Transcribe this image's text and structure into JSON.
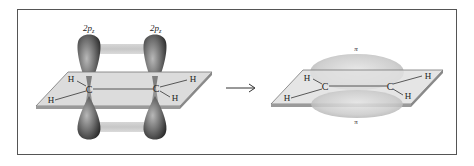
{
  "figure": {
    "left_panel": {
      "orbital_labels": [
        "2p",
        "2p"
      ],
      "orbital_subscript": "z",
      "atoms": {
        "carbon": [
          "C",
          "C"
        ],
        "hydrogen": [
          "H",
          "H",
          "H",
          "H"
        ]
      }
    },
    "arrow": "→",
    "right_panel": {
      "bond_labels": {
        "top": "π",
        "bottom": "π"
      },
      "atoms": {
        "carbon": [
          "C",
          "C"
        ],
        "hydrogen": [
          "H",
          "H",
          "H",
          "H"
        ]
      }
    },
    "colors": {
      "border": "#555555",
      "plane_fill": "#d9d9d9",
      "plane_edge": "#8a8a8a",
      "lobe_dark": "#3a3a3a",
      "lobe_mid": "#8c8c8c",
      "pi_cloud": "#c8c8c8"
    }
  }
}
